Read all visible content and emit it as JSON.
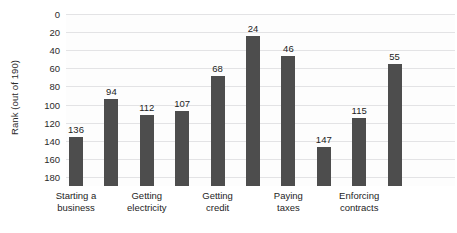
{
  "chart_data": {
    "type": "bar",
    "title": "",
    "subtitle": "",
    "xlabel": "",
    "ylabel": "Rank (out of 190)",
    "ylim": [
      0,
      190
    ],
    "y_inverted": true,
    "grid": true,
    "legend": null,
    "y_ticks": [
      "0",
      "20",
      "40",
      "60",
      "80",
      "100",
      "120",
      "140",
      "160",
      "180"
    ],
    "y_tick_values": [
      0,
      20,
      40,
      60,
      80,
      100,
      120,
      140,
      160,
      180
    ],
    "bar_color": "#4d4d4d",
    "gridline_color": "#e3e3e5",
    "plot_background": "#fdfdfd",
    "categories": [
      "Starting a business",
      "",
      "Getting electricity",
      "",
      "Getting credit",
      "",
      "Paying taxes",
      "",
      "Enforcing contracts",
      ""
    ],
    "visible_category_labels": [
      {
        "index": 0,
        "line1": "Starting a",
        "line2": "business"
      },
      {
        "index": 2,
        "line1": "Getting",
        "line2": "electricity"
      },
      {
        "index": 4,
        "line1": "Getting",
        "line2": "credit"
      },
      {
        "index": 6,
        "line1": "Paying",
        "line2": "taxes"
      },
      {
        "index": 8,
        "line1": "Enforcing",
        "line2": "contracts"
      }
    ],
    "values": [
      136,
      94,
      112,
      107,
      68,
      24,
      46,
      147,
      115,
      55
    ],
    "data_labels": [
      "136",
      "94",
      "112",
      "107",
      "68",
      "24",
      "46",
      "147",
      "115",
      "55"
    ]
  }
}
